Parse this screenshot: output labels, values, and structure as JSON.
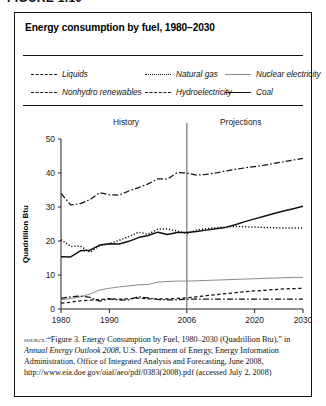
{
  "figure_label": "FIGURE 1.10",
  "title": "Energy consumption by fuel, 1980–2030",
  "legend": {
    "items": [
      {
        "label": "Liquids",
        "style": "dashdot",
        "color": "#111111"
      },
      {
        "label": "Nonhydro renewables",
        "style": "dash",
        "color": "#111111"
      },
      {
        "label": "Natural gas",
        "style": "dot",
        "color": "#111111"
      },
      {
        "label": "Hydroelectricity",
        "style": "dashdot",
        "color": "#111111"
      },
      {
        "label": "Nuclear electricity",
        "style": "solid-thin",
        "color": "#8b8b8b"
      },
      {
        "label": "Coal",
        "style": "solid-thick",
        "color": "#111111"
      }
    ]
  },
  "annotations": {
    "history": "History",
    "projections": "Projections",
    "divider_year": 2006
  },
  "source": {
    "prefix": "source:",
    "line1": "“Figure 3. Energy Consumption by Fuel, 1980–2030 (Quadrillion Btu),” in ",
    "italic": "Annual Energy Outlook 2008",
    "line2": ", U.S. Department of Energy, Energy Information Administration, Office of Integrated Analysis and Forecasting, June 2008, http://www.eia.doe.gov/oiaf/aeo/pdf/0383(2008).pdf (accessed July 2, 2008)"
  },
  "chart_data": {
    "type": "line",
    "title": "Energy consumption by fuel, 1980–2030",
    "xlabel": "",
    "ylabel": "Quadrillion Btu",
    "xlim": [
      1980,
      2030
    ],
    "ylim": [
      0,
      50
    ],
    "yticks": [
      0,
      10,
      20,
      30,
      40,
      50
    ],
    "xticks": [
      1980,
      1990,
      2006,
      2020,
      2030
    ],
    "grid": false,
    "legend_position": "top",
    "x": [
      1980,
      1982,
      1984,
      1986,
      1988,
      1990,
      1992,
      1994,
      1996,
      1998,
      2000,
      2002,
      2004,
      2006,
      2008,
      2010,
      2012,
      2014,
      2016,
      2018,
      2020,
      2022,
      2024,
      2026,
      2028,
      2030
    ],
    "series": [
      {
        "name": "Liquids",
        "style": "dashdot",
        "values": [
          34.0,
          30.6,
          31.0,
          32.2,
          34.2,
          33.6,
          33.5,
          34.7,
          35.7,
          36.8,
          38.3,
          38.2,
          40.1,
          40.0,
          39.4,
          39.6,
          40.0,
          40.6,
          41.1,
          41.5,
          41.9,
          42.3,
          42.8,
          43.3,
          43.8,
          44.3
        ]
      },
      {
        "name": "Natural gas",
        "style": "dot",
        "values": [
          20.4,
          18.4,
          18.5,
          16.7,
          18.6,
          19.2,
          20.2,
          21.3,
          22.6,
          22.0,
          23.5,
          23.6,
          22.9,
          22.2,
          23.2,
          23.6,
          23.9,
          24.1,
          24.3,
          24.2,
          24.1,
          24.0,
          23.9,
          23.8,
          23.8,
          23.8
        ]
      },
      {
        "name": "Coal",
        "style": "solid-thick",
        "values": [
          15.4,
          15.3,
          17.1,
          17.3,
          18.8,
          19.2,
          19.1,
          19.9,
          21.0,
          21.6,
          22.6,
          21.9,
          22.5,
          22.5,
          22.8,
          23.2,
          23.6,
          24.0,
          24.8,
          25.7,
          26.5,
          27.3,
          28.1,
          28.8,
          29.5,
          30.2
        ]
      },
      {
        "name": "Nuclear electricity",
        "style": "solid-thin",
        "values": [
          2.7,
          3.1,
          3.6,
          4.4,
          5.6,
          6.1,
          6.5,
          6.8,
          7.1,
          7.2,
          7.9,
          8.1,
          8.2,
          8.2,
          8.3,
          8.4,
          8.5,
          8.6,
          8.7,
          8.8,
          8.9,
          9.0,
          9.1,
          9.2,
          9.3,
          9.3
        ]
      },
      {
        "name": "Nonhydro renewables",
        "style": "dash",
        "values": [
          1.7,
          2.0,
          2.4,
          2.6,
          2.8,
          3.0,
          2.9,
          3.0,
          3.2,
          3.0,
          3.0,
          3.0,
          3.1,
          3.3,
          3.6,
          3.9,
          4.2,
          4.5,
          4.8,
          5.1,
          5.3,
          5.5,
          5.7,
          5.9,
          6.0,
          6.1
        ]
      },
      {
        "name": "Hydroelectricity",
        "style": "dashdot",
        "values": [
          3.1,
          3.6,
          3.8,
          3.4,
          2.3,
          3.0,
          2.6,
          2.7,
          3.6,
          3.3,
          2.8,
          2.7,
          2.7,
          2.9,
          2.9,
          2.9,
          2.9,
          2.9,
          2.9,
          2.9,
          2.9,
          2.9,
          2.9,
          2.9,
          2.9,
          2.9
        ]
      }
    ]
  }
}
